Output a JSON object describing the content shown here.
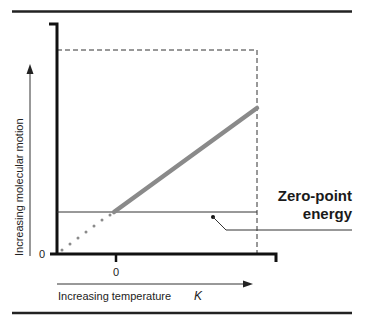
{
  "diagram": {
    "type": "energy-vs-temperature",
    "y_axis": {
      "label": "Increasing molecular motion",
      "origin_label": "0"
    },
    "x_axis": {
      "label": "Increasing temperature",
      "unit": "K",
      "zero_tick_label": "0"
    },
    "annotation": {
      "line1": "Zero-point",
      "line2": "energy"
    },
    "colors": {
      "axis": "#111111",
      "thick_line": "#8a8a8a",
      "thin_line": "#333333",
      "dashed_box": "#333333",
      "rule": "#222222"
    },
    "elements": [
      "top-rule",
      "y-axis",
      "x-axis",
      "dashed-bounding-box",
      "zero-point-energy-line",
      "molecular-motion-line",
      "dotted-extrapolation",
      "leader-line",
      "y-arrow",
      "x-arrow",
      "bottom-rule"
    ]
  }
}
